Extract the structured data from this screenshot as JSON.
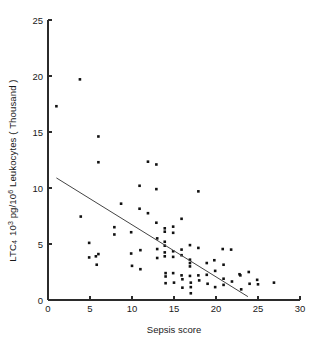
{
  "chart_data": {
    "type": "scatter",
    "title": "",
    "xlabel": "Sepsis score",
    "ylabel_parts": {
      "prefix": "LTC",
      "sub1": "4",
      "mid": "10",
      "sup1": "3",
      "unit": " pg/10",
      "sup2": "6",
      "suffix": " Leukocytes ( Thousand )"
    },
    "ylabel_plain": "LTC4 10^3 pg/10^6 Leukocytes ( Thousand )",
    "xlim": [
      0,
      30
    ],
    "ylim": [
      0,
      25
    ],
    "xticks": [
      0,
      5,
      10,
      15,
      20,
      25,
      30
    ],
    "yticks": [
      0,
      5,
      10,
      15,
      20,
      25
    ],
    "grid": false,
    "legend": null,
    "marker_color": "#111111",
    "line_color": "#444444",
    "axis_color": "#2b2b2b",
    "trendline": {
      "label": "regression line",
      "x0": 1.0,
      "y0": 10.9,
      "x1": 23.8,
      "y1": 0.3
    },
    "points": [
      [
        1.0,
        17.3
      ],
      [
        3.8,
        19.7
      ],
      [
        3.9,
        7.45
      ],
      [
        4.9,
        5.1
      ],
      [
        4.9,
        3.8
      ],
      [
        5.7,
        3.9
      ],
      [
        5.8,
        3.15
      ],
      [
        6.0,
        14.6
      ],
      [
        6.0,
        12.3
      ],
      [
        6.0,
        4.1
      ],
      [
        7.9,
        6.5
      ],
      [
        7.9,
        5.85
      ],
      [
        8.7,
        8.6
      ],
      [
        9.9,
        6.05
      ],
      [
        9.9,
        4.15
      ],
      [
        10.0,
        3.05
      ],
      [
        10.9,
        10.2
      ],
      [
        10.9,
        8.15
      ],
      [
        11.0,
        4.45
      ],
      [
        11.0,
        2.75
      ],
      [
        11.9,
        12.35
      ],
      [
        11.9,
        7.75
      ],
      [
        12.9,
        12.1
      ],
      [
        12.9,
        9.9
      ],
      [
        12.9,
        6.9
      ],
      [
        13.0,
        5.5
      ],
      [
        13.0,
        4.55
      ],
      [
        13.0,
        3.75
      ],
      [
        13.9,
        6.4
      ],
      [
        13.9,
        6.1
      ],
      [
        13.9,
        5.2
      ],
      [
        13.9,
        4.85
      ],
      [
        13.9,
        4.25
      ],
      [
        13.9,
        3.9
      ],
      [
        14.0,
        2.4
      ],
      [
        14.0,
        2.1
      ],
      [
        14.0,
        1.5
      ],
      [
        14.9,
        6.55
      ],
      [
        14.9,
        6.0
      ],
      [
        14.9,
        4.35
      ],
      [
        14.9,
        3.85
      ],
      [
        14.9,
        2.4
      ],
      [
        15.0,
        1.55
      ],
      [
        15.9,
        7.25
      ],
      [
        15.9,
        4.5
      ],
      [
        15.9,
        4.0
      ],
      [
        15.9,
        2.2
      ],
      [
        16.0,
        1.85
      ],
      [
        16.0,
        1.1
      ],
      [
        16.9,
        4.9
      ],
      [
        16.9,
        3.6
      ],
      [
        16.9,
        3.3
      ],
      [
        16.9,
        3.0
      ],
      [
        16.9,
        2.15
      ],
      [
        17.0,
        1.55
      ],
      [
        17.0,
        1.15
      ],
      [
        17.0,
        0.6
      ],
      [
        17.9,
        9.7
      ],
      [
        17.9,
        4.65
      ],
      [
        17.9,
        2.2
      ],
      [
        18.0,
        1.75
      ],
      [
        18.9,
        3.3
      ],
      [
        18.9,
        2.25
      ],
      [
        19.0,
        1.45
      ],
      [
        19.8,
        3.55
      ],
      [
        19.9,
        2.6
      ],
      [
        19.9,
        1.15
      ],
      [
        20.8,
        4.55
      ],
      [
        20.9,
        3.15
      ],
      [
        20.9,
        1.9
      ],
      [
        20.9,
        1.35
      ],
      [
        21.8,
        4.5
      ],
      [
        21.9,
        1.65
      ],
      [
        22.8,
        2.3
      ],
      [
        22.9,
        2.2
      ],
      [
        23.0,
        0.95
      ],
      [
        23.9,
        2.5
      ],
      [
        24.0,
        1.45
      ],
      [
        24.9,
        1.8
      ],
      [
        25.0,
        1.4
      ],
      [
        26.9,
        1.55
      ]
    ]
  }
}
